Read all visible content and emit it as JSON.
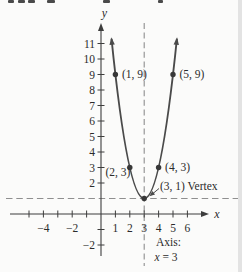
{
  "colors": {
    "background": "#fbfbfa",
    "ink": "#2b2b2b",
    "axis": "#3d3d3d",
    "curve": "#4a4a4a",
    "point": "#383838",
    "dashed": "#8f8f8f",
    "edge_band": "#e3e3e3"
  },
  "chart_data": {
    "type": "line",
    "subtype": "parabola",
    "title": "",
    "grid": false,
    "function": {
      "a": 2,
      "h": 3,
      "k": 1
    },
    "x_drawn_range": [
      0.73,
      5.27
    ],
    "xlim": [
      -6.3,
      7.0
    ],
    "ylim": [
      -3.7,
      12.3
    ],
    "x_axis_letter": "x",
    "y_axis_letter": "y",
    "x_ticks": [
      -5,
      -4,
      -3,
      -2,
      -1,
      1,
      2,
      3,
      4,
      5,
      6
    ],
    "x_tick_labels": [
      "",
      "−4",
      "",
      "−2",
      "",
      "1",
      "2",
      "3",
      "4",
      "5",
      "6"
    ],
    "y_ticks": [
      -2,
      -1,
      2,
      3,
      4,
      5,
      6,
      7,
      8,
      9,
      10,
      11
    ],
    "y_tick_labels": [
      "−2",
      "",
      "2",
      "3",
      "4",
      "5",
      "6",
      "7",
      "8",
      "9",
      "10",
      "11"
    ],
    "points": [
      {
        "x": 1,
        "y": 9,
        "label": "(1, 9)",
        "label_side": "right"
      },
      {
        "x": 2,
        "y": 3,
        "label": "(2, 3)",
        "label_side": "left-below"
      },
      {
        "x": 4,
        "y": 3,
        "label": "(4, 3)",
        "label_side": "right"
      },
      {
        "x": 5,
        "y": 9,
        "label": "(5, 9)",
        "label_side": "right"
      },
      {
        "x": 3,
        "y": 1,
        "label": "(3, 1) Vertex",
        "label_side": "callout"
      }
    ],
    "vertex": {
      "x": 3,
      "y": 1,
      "label": "(3, 1) Vertex"
    },
    "axis_of_symmetry": {
      "x": 3,
      "note_line1": "Axis:",
      "note_line2": "x = 3"
    },
    "horizontal_guide_y": 1,
    "legend": null
  }
}
